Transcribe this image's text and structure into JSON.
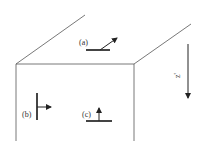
{
  "diagram": {
    "type": "3d-box-cross-section",
    "labels": {
      "a": "(a)",
      "b": "(b)",
      "c": "(c)",
      "axis": "z'"
    },
    "symbols": [
      {
        "id": "a",
        "location": "top face",
        "orientation": "horizontal bar with diagonal arrow up-right"
      },
      {
        "id": "b",
        "location": "front face left",
        "orientation": "vertical bar with arrow pointing right"
      },
      {
        "id": "c",
        "location": "front face center",
        "orientation": "horizontal bar with arrow pointing up"
      }
    ],
    "axis_arrow": {
      "direction": "down",
      "label": "z'"
    },
    "colors": {
      "line": "#555555",
      "symbol": "#222222",
      "background": "#ffffff"
    }
  }
}
